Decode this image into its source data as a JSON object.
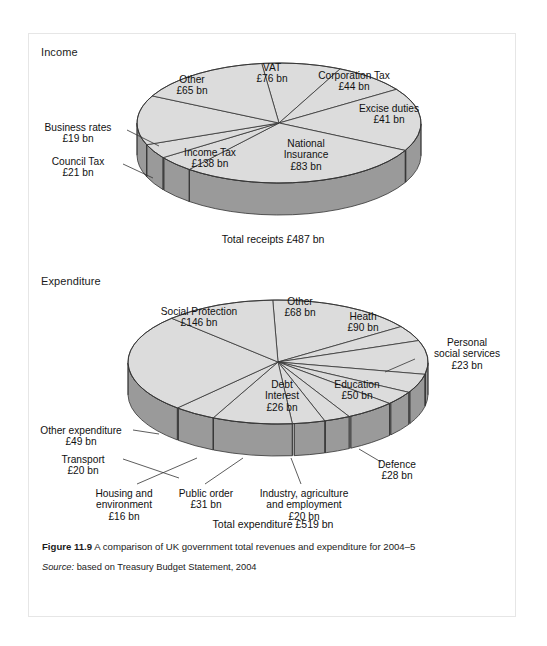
{
  "figure": {
    "caption_label": "Figure 11.9",
    "caption_text": " A comparison of UK government total revenues and expenditure for 2004–5",
    "source_label": "Source:",
    "source_text": " based on Treasury Budget Statement, 2004"
  },
  "colors": {
    "slice_top": "#dcdcdc",
    "slice_side": "#9a9a9a",
    "slice_side_dark": "#8c8c8c",
    "outline": "#333333",
    "page_bg": "#ffffff",
    "page_border": "#e6e6e6",
    "text": "#111111"
  },
  "panels": {
    "income": {
      "title": "Income",
      "total": "Total receipts £487 bn"
    },
    "expenditure": {
      "title": "Expenditure",
      "total": "Total expenditure £519 bn"
    }
  },
  "chart_data": [
    {
      "type": "pie",
      "title": "Income",
      "subtitle": "Total receipts £487 bn",
      "unit": "£ bn",
      "total": 487,
      "categories": [
        "VAT",
        "Corporation Tax",
        "Excise duties",
        "National Insurance",
        "Income Tax",
        "Council Tax",
        "Business rates",
        "Other"
      ],
      "values": [
        76,
        44,
        41,
        83,
        138,
        21,
        19,
        65
      ],
      "labels": [
        {
          "name": "VAT",
          "value": "£76 bn"
        },
        {
          "name": "Corporation Tax",
          "value": "£44 bn"
        },
        {
          "name": "Excise duties",
          "value": "£41 bn"
        },
        {
          "name": "National Insurance",
          "value": "£83 bn"
        },
        {
          "name": "Income Tax",
          "value": "£138 bn"
        },
        {
          "name": "Council Tax",
          "value": "£21 bn"
        },
        {
          "name": "Business rates",
          "value": "£19 bn"
        },
        {
          "name": "Other",
          "value": "£65 bn"
        }
      ],
      "legend": "none",
      "grid": false
    },
    {
      "type": "pie",
      "title": "Expenditure",
      "subtitle": "Total expenditure £519 bn",
      "unit": "£ bn",
      "total": 519,
      "categories": [
        "Other",
        "Heath",
        "Personal social services",
        "Education",
        "Defence",
        "Industry, agriculture and employment",
        "Public order",
        "Housing and environment",
        "Transport",
        "Other expenditure",
        "Debt Interest",
        "Social Protection"
      ],
      "values": [
        68,
        90,
        23,
        50,
        28,
        20,
        31,
        16,
        20,
        49,
        26,
        146
      ],
      "labels": [
        {
          "name": "Other",
          "value": "£68 bn"
        },
        {
          "name": "Heath",
          "value": "£90 bn"
        },
        {
          "name": "Personal social services",
          "value": "£23 bn"
        },
        {
          "name": "Education",
          "value": "£50 bn"
        },
        {
          "name": "Defence",
          "value": "£28 bn"
        },
        {
          "name": "Industry, agriculture and employment",
          "value": "£20 bn"
        },
        {
          "name": "Public order",
          "value": "£31 bn"
        },
        {
          "name": "Housing and environment",
          "value": "£16 bn"
        },
        {
          "name": "Transport",
          "value": "£20 bn"
        },
        {
          "name": "Other expenditure",
          "value": "£49 bn"
        },
        {
          "name": "Debt Interest",
          "value": "£26 bn"
        },
        {
          "name": "Social Protection",
          "value": "£146 bn"
        }
      ],
      "legend": "none",
      "grid": false
    }
  ],
  "income_labels": {
    "vat": {
      "l1": "VAT",
      "l2": "£76 bn"
    },
    "corporation_tax": {
      "l1": "Corporation Tax",
      "l2": "£44 bn"
    },
    "excise_duties": {
      "l1": "Excise duties",
      "l2": "£41 bn"
    },
    "national_insurance": {
      "l1": "National",
      "l2": "Insurance",
      "l3": "£83 bn"
    },
    "income_tax": {
      "l1": "Income Tax",
      "l2": "£138 bn"
    },
    "council_tax": {
      "l1": "Council Tax",
      "l2": "£21 bn"
    },
    "business_rates": {
      "l1": "Business rates",
      "l2": "£19 bn"
    },
    "other": {
      "l1": "Other",
      "l2": "£65 bn"
    }
  },
  "expenditure_labels": {
    "social_protection": {
      "l1": "Social Protection",
      "l2": "£146 bn"
    },
    "other": {
      "l1": "Other",
      "l2": "£68 bn"
    },
    "heath": {
      "l1": "Heath",
      "l2": "£90 bn"
    },
    "personal_social_services": {
      "l1": "Personal",
      "l2": "social services",
      "l3": "£23 bn"
    },
    "education": {
      "l1": "Education",
      "l2": "£50 bn"
    },
    "defence": {
      "l1": "Defence",
      "l2": "£28 bn"
    },
    "debt_interest": {
      "l1": "Debt",
      "l2": "Interest",
      "l3": "£26 bn"
    },
    "industry": {
      "l1": "Industry, agriculture",
      "l2": "and employment",
      "l3": "£20 bn"
    },
    "public_order": {
      "l1": "Public order",
      "l2": "£31 bn"
    },
    "housing": {
      "l1": "Housing and",
      "l2": "environment",
      "l3": "£16 bn"
    },
    "transport": {
      "l1": "Transport",
      "l2": "£20 bn"
    },
    "other_expenditure": {
      "l1": "Other expenditure",
      "l2": "£49 bn"
    }
  },
  "geometry": {
    "income": {
      "cx": 250,
      "cy": 89,
      "rx": 142,
      "ry": 60,
      "depth": 32,
      "start_angle": -97,
      "order": [
        "Corporation Tax",
        "Excise duties",
        "National Insurance",
        "Income Tax",
        "Council Tax",
        "Business rates",
        "Other",
        "VAT"
      ]
    },
    "expenditure": {
      "cx": 249,
      "cy": 328,
      "rx": 150,
      "ry": 62,
      "depth": 32,
      "start_angle": -92,
      "order": [
        "Heath",
        "Personal social services",
        "Education",
        "Defence",
        "Industry, agriculture and employment",
        "Public order",
        "Housing and environment",
        "Transport",
        "Other expenditure",
        "Debt Interest",
        "Social Protection",
        "Other"
      ]
    }
  }
}
